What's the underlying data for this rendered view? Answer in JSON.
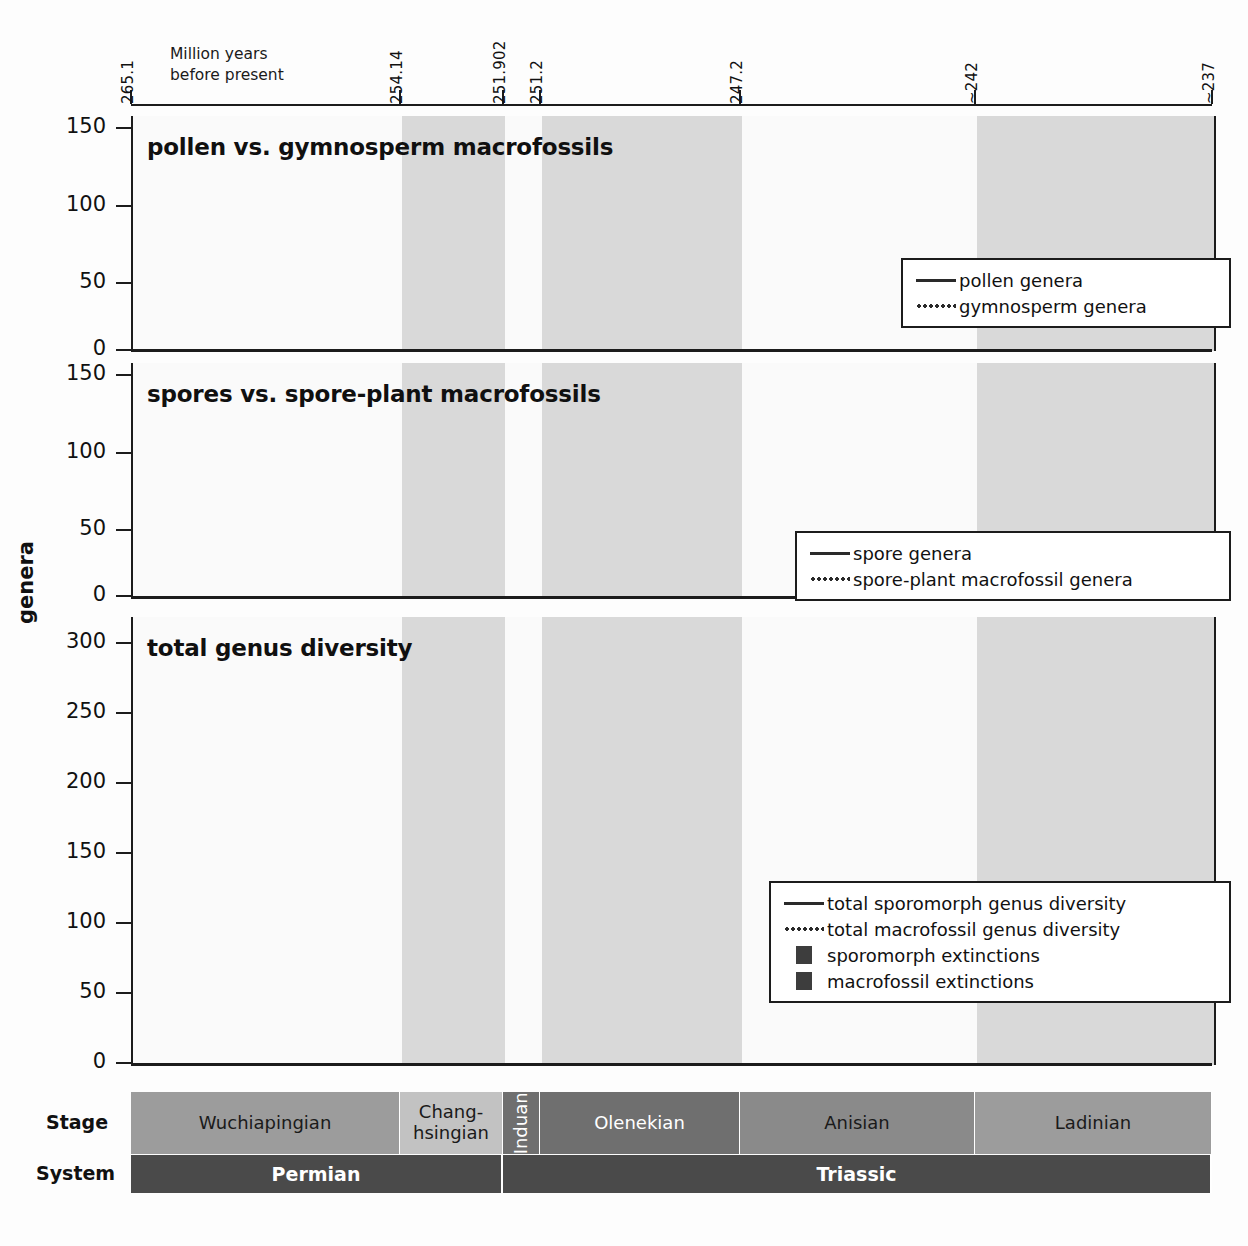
{
  "axis": {
    "caption_line1": "Million years",
    "caption_line2": "before present",
    "ylabel_title": "genera",
    "top_ticks": [
      {
        "label": "265.1",
        "x": 131
      },
      {
        "label": "254.14",
        "x": 400
      },
      {
        "label": "251.902",
        "x": 503
      },
      {
        "label": "251.2",
        "x": 540
      },
      {
        "label": "247.2",
        "x": 740
      },
      {
        "label": "~242",
        "x": 975
      },
      {
        "label": "~237",
        "x": 1212
      }
    ]
  },
  "panels": [
    {
      "id": "pollen-vs-gymnosperm",
      "title": "pollen vs. gymnosperm macrofossils",
      "y_ticks": [
        "150",
        "100",
        "50",
        "0"
      ],
      "legend": [
        {
          "style": "solid",
          "label": "pollen genera"
        },
        {
          "style": "dotted",
          "label": "gymnosperm genera"
        }
      ]
    },
    {
      "id": "spores-vs-spore-plant",
      "title": "spores vs. spore-plant macrofossils",
      "y_ticks": [
        "150",
        "100",
        "50",
        "0"
      ],
      "legend": [
        {
          "style": "solid",
          "label": "spore genera"
        },
        {
          "style": "dotted",
          "label": "spore-plant macrofossil genera"
        }
      ]
    },
    {
      "id": "total-genus-diversity",
      "title": "total genus diversity",
      "y_ticks": [
        "300",
        "250",
        "200",
        "150",
        "100",
        "50",
        "0"
      ],
      "legend": [
        {
          "style": "solid",
          "label": "total sporomorph genus diversity"
        },
        {
          "style": "dotted",
          "label": "total macrofossil genus diversity"
        },
        {
          "style": "square",
          "label": "sporomorph extinctions"
        },
        {
          "style": "square",
          "label": "macrofossil extinctions"
        }
      ]
    }
  ],
  "timescale": {
    "stage_row_label": "Stage",
    "system_row_label": "System",
    "stages": [
      {
        "name": "Wuchiapingian",
        "x0": 131,
        "x1": 400,
        "fill": "#9c9c9c",
        "text": "#1a1a1a",
        "vertical": false
      },
      {
        "name": "Chang-\nhsingian",
        "x0": 400,
        "x1": 503,
        "fill": "#c2c2c2",
        "text": "#1a1a1a",
        "vertical": false
      },
      {
        "name": "Induan",
        "x0": 503,
        "x1": 540,
        "fill": "#6f6f6f",
        "text": "#ffffff",
        "vertical": true
      },
      {
        "name": "Olenekian",
        "x0": 540,
        "x1": 740,
        "fill": "#6f6f6f",
        "text": "#ffffff",
        "vertical": false
      },
      {
        "name": "Anisian",
        "x0": 740,
        "x1": 975,
        "fill": "#8a8a8a",
        "text": "#1a1a1a",
        "vertical": false
      },
      {
        "name": "Ladinian",
        "x0": 975,
        "x1": 1212,
        "fill": "#9c9c9c",
        "text": "#1a1a1a",
        "vertical": false
      }
    ],
    "systems": [
      {
        "name": "Permian",
        "x0": 131,
        "x1": 503
      },
      {
        "name": "Triassic",
        "x0": 503,
        "x1": 1212
      }
    ]
  },
  "colors": {
    "ink": "#1c1c1c",
    "panel_bg": "#f2f2f2",
    "band_shade": "#d9d9d9",
    "band_light": "#fafafa",
    "bar_fill": "#3d3d3d"
  },
  "chart_data": {
    "type": "line",
    "xlabel": "Million years before present",
    "ylabel": "genera",
    "x_axis_ticks": [
      265.1,
      254.14,
      251.902,
      251.2,
      247.2,
      242,
      237
    ],
    "x_axis_tick_labels": [
      "265.1",
      "254.14",
      "251.902",
      "251.2",
      "247.2",
      "~242",
      "~237"
    ],
    "x_direction": "older-to-younger (left to right)",
    "stage_midpoints_ma": [
      259.6,
      253.0,
      251.55,
      249.2,
      244.6,
      239.5
    ],
    "stage_names": [
      "Wuchiapingian",
      "Changhsingian",
      "Induan",
      "Olenekian",
      "Anisian",
      "Ladinian"
    ],
    "grid": false,
    "panels": [
      {
        "title": "pollen vs. gymnosperm macrofossils",
        "ylim": [
          0,
          160
        ],
        "y_ticks": [
          0,
          50,
          100,
          150
        ],
        "legend_position": "bottom-right",
        "series": [
          {
            "name": "pollen genera",
            "style": "solid",
            "categories": [
              "Wuchiapingian",
              "Changhsingian",
              "Induan",
              "Olenekian",
              "Anisian",
              "Ladinian"
            ],
            "values": [
              90,
              100,
              107,
              101,
              124,
              106
            ]
          },
          {
            "name": "gymnosperm genera",
            "style": "dotted",
            "categories": [
              "Wuchiapingian",
              "Changhsingian",
              "Induan",
              "Olenekian",
              "Anisian",
              "Ladinian"
            ],
            "values": [
              97,
              93,
              75,
              85,
              87,
              91
            ]
          }
        ]
      },
      {
        "title": "spores vs. spore-plant macrofossils",
        "ylim": [
          0,
          160
        ],
        "y_ticks": [
          0,
          50,
          100,
          150
        ],
        "legend_position": "bottom-right",
        "series": [
          {
            "name": "spore genera",
            "style": "solid",
            "categories": [
              "Wuchiapingian",
              "Changhsingian",
              "Induan",
              "Olenekian",
              "Anisian",
              "Ladinian"
            ],
            "values": [
              105,
              122,
              115,
              118,
              124,
              100
            ]
          },
          {
            "name": "spore-plant macrofossil genera",
            "style": "dotted",
            "categories": [
              "Wuchiapingian",
              "Changhsingian",
              "Induan",
              "Olenekian",
              "Anisian",
              "Ladinian"
            ],
            "values": [
              53,
              68,
              52,
              53,
              56,
              63
            ]
          }
        ]
      },
      {
        "title": "total genus diversity",
        "ylim": [
          0,
          310
        ],
        "y_ticks": [
          0,
          50,
          100,
          150,
          200,
          250,
          300
        ],
        "legend_position": "bottom-right",
        "series": [
          {
            "name": "total sporomorph genus diversity",
            "style": "solid",
            "categories": [
              "Wuchiapingian",
              "Changhsingian",
              "Induan",
              "Olenekian",
              "Anisian",
              "Ladinian"
            ],
            "values": [
              202,
              231,
              235,
              240,
              269,
              230
            ]
          },
          {
            "name": "total macrofossil genus diversity",
            "style": "dotted",
            "categories": [
              "Wuchiapingian",
              "Changhsingian",
              "Induan",
              "Olenekian",
              "Anisian",
              "Ladinian"
            ],
            "values": [
              176,
              191,
              141,
              154,
              155,
              176
            ]
          },
          {
            "name": "sporomorph extinctions",
            "style": "bar",
            "categories": [
              "Changhsingian",
              "Induan",
              "Olenekian",
              "Anisian"
            ],
            "values": [
              36,
              35,
              16,
              16
            ]
          },
          {
            "name": "macrofossil extinctions",
            "style": "bar",
            "categories": [
              "Changhsingian",
              "Induan",
              "Olenekian",
              "Anisian"
            ],
            "values": [
              39,
              25,
              26,
              40
            ]
          }
        ]
      }
    ]
  }
}
